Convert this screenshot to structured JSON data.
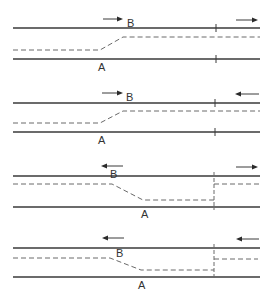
{
  "diagram": {
    "panels": [
      {
        "id": 1,
        "label_A": "A",
        "label_B": "B",
        "center_line": "shifts up (A to B) in direction of travel",
        "arrow_left_direction": "right",
        "arrow_right_direction": "right",
        "end_marker": "tick"
      },
      {
        "id": 2,
        "label_A": "A",
        "label_B": "B",
        "center_line": "shifts up (A to B)",
        "arrow_left_direction": "right",
        "arrow_right_direction": "left",
        "end_marker": "tick"
      },
      {
        "id": 3,
        "label_A": "A",
        "label_B": "B",
        "center_line": "shifts down (B to A)",
        "arrow_left_direction": "left",
        "arrow_right_direction": "right",
        "end_marker": "dashed-vertical"
      },
      {
        "id": 4,
        "label_A": "A",
        "label_B": "B",
        "center_line": "shifts down (B to A)",
        "arrow_left_direction": "left",
        "arrow_right_direction": "left",
        "end_marker": "dashed-vertical"
      }
    ]
  }
}
